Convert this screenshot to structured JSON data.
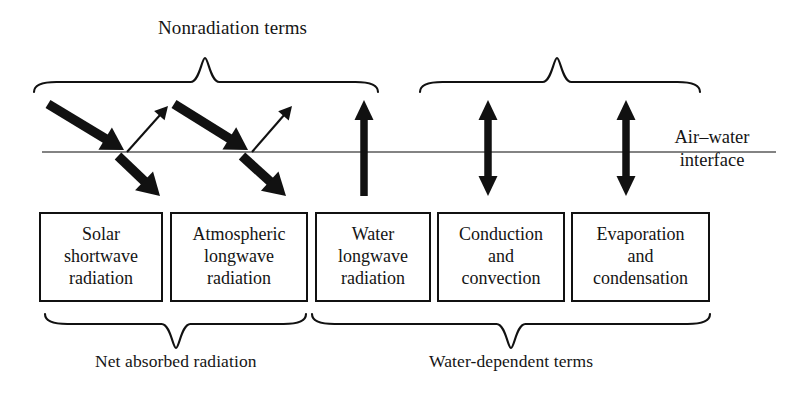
{
  "figure": {
    "kind": "air-water-interface-heat-flux-diagram",
    "background_color": "#ffffff",
    "line_color": "#111111"
  },
  "top_groups": [
    {
      "id": "radiation-terms",
      "label": "Radiation terms",
      "brace": {
        "x_start": 34,
        "x_end": 378,
        "peak_x": 205,
        "y_top": 58,
        "y_bottom": 92
      },
      "label_x": 205,
      "label_y": 18
    },
    {
      "id": "nonradiation-terms",
      "label": "Nonradiation terms",
      "brace": {
        "x_start": 420,
        "x_end": 700,
        "peak_x": 557,
        "y_top": 58,
        "y_bottom": 92
      },
      "label_x": 557,
      "label_y": 18
    }
  ],
  "interface": {
    "label": "Air–water\ninterface",
    "line": {
      "x_start": 42,
      "x_end": 776,
      "y": 152
    },
    "label_x": 712,
    "label_y": 126
  },
  "arrows": [
    {
      "id": "solar-incoming",
      "semantic": "incoming-solar-shortwave",
      "style": "thick",
      "direction": "down-right",
      "x1": 48,
      "y1": 104,
      "x2": 124,
      "y2": 150
    },
    {
      "id": "solar-reflected",
      "semantic": "reflected-solar-shortwave",
      "style": "thin",
      "direction": "up-right",
      "x1": 127,
      "y1": 152,
      "x2": 168,
      "y2": 106
    },
    {
      "id": "solar-transmitted",
      "semantic": "transmitted-solar-shortwave",
      "style": "thick",
      "direction": "down-right",
      "x1": 118,
      "y1": 156,
      "x2": 160,
      "y2": 196
    },
    {
      "id": "atmospheric-incoming",
      "semantic": "incoming-atmospheric-longwave",
      "style": "thick",
      "direction": "down-right",
      "x1": 174,
      "y1": 104,
      "x2": 248,
      "y2": 150
    },
    {
      "id": "atmospheric-reflected",
      "semantic": "reflected-atmospheric-longwave",
      "style": "thin",
      "direction": "up-right",
      "x1": 252,
      "y1": 152,
      "x2": 292,
      "y2": 106
    },
    {
      "id": "atmospheric-transmitted",
      "semantic": "transmitted-atmospheric-longwave",
      "style": "thick",
      "direction": "down-right",
      "x1": 242,
      "y1": 156,
      "x2": 286,
      "y2": 196
    },
    {
      "id": "water-longwave-emission",
      "semantic": "upward-water-longwave-radiation",
      "style": "thick-vertical",
      "direction": "up",
      "x": 364,
      "y_top": 100,
      "y_bottom": 196,
      "double_headed": false
    },
    {
      "id": "conduction-convection-exchange",
      "semantic": "bidirectional-conduction-convection",
      "style": "thick-vertical",
      "direction": "both",
      "x": 488,
      "y_top": 100,
      "y_bottom": 196,
      "double_headed": true
    },
    {
      "id": "evaporation-condensation-exchange",
      "semantic": "bidirectional-evaporation-condensation",
      "style": "thick-vertical",
      "direction": "both",
      "x": 626,
      "y_top": 100,
      "y_bottom": 196,
      "double_headed": true
    }
  ],
  "boxes": [
    {
      "id": "solar-shortwave-radiation",
      "label": "Solar\nshortwave\nradiation",
      "x": 39,
      "y": 212,
      "width": 124,
      "height": 90
    },
    {
      "id": "atmospheric-longwave-radiation",
      "label": "Atmospheric\nlongwave\nradiation",
      "x": 170,
      "y": 212,
      "width": 138,
      "height": 90
    },
    {
      "id": "water-longwave-radiation",
      "label": "Water\nlongwave\nradiation",
      "x": 315,
      "y": 212,
      "width": 116,
      "height": 90
    },
    {
      "id": "conduction-and-convection",
      "label": "Conduction\nand\nconvection",
      "x": 437,
      "y": 212,
      "width": 128,
      "height": 90
    },
    {
      "id": "evaporation-and-condensation",
      "label": "Evaporation\nand\ncondensation",
      "x": 571,
      "y": 212,
      "width": 139,
      "height": 90
    }
  ],
  "bottom_groups": [
    {
      "id": "net-absorbed-radiation",
      "label": "Net absorbed radiation",
      "brace": {
        "x_start": 45,
        "x_end": 306,
        "peak_x": 176,
        "y_top": 314,
        "y_bottom": 348
      },
      "label_x": 176,
      "label_y": 352
    },
    {
      "id": "water-dependent-terms",
      "label": "Water-dependent terms",
      "brace": {
        "x_start": 312,
        "x_end": 710,
        "peak_x": 511,
        "y_top": 314,
        "y_bottom": 348
      },
      "label_x": 511,
      "label_y": 352
    }
  ]
}
